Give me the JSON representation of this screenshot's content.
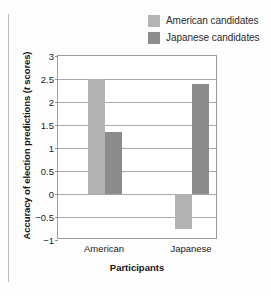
{
  "chart_data": {
    "type": "bar",
    "title": "",
    "xlabel": "Participants",
    "ylabel_prefix": "Accuracy of election predictions (",
    "ylabel_italic": "t",
    "ylabel_suffix": " scores)",
    "ylabel_full": "Accuracy of election predictions (t scores)",
    "categories": [
      "American",
      "Japanese"
    ],
    "series": [
      {
        "name": "American candidates",
        "color": "#b3b3b3",
        "values": [
          2.5,
          -0.75
        ]
      },
      {
        "name": "Japanese candidates",
        "color": "#8c8c8c",
        "values": [
          1.35,
          2.4
        ]
      }
    ],
    "ylim": [
      -1,
      3
    ],
    "yticks": [
      "3",
      "2.5",
      "2",
      "1.5",
      "1",
      "0.5",
      "0",
      "−0.5",
      "−1"
    ],
    "ytick_values": [
      3,
      2.5,
      2,
      1.5,
      1,
      0.5,
      0,
      -0.5,
      -1
    ],
    "grid": true,
    "legend_position": "top-right"
  },
  "legend": {
    "entries": [
      {
        "label": "American candidates",
        "swatch": "light"
      },
      {
        "label": "Japanese candidates",
        "swatch": "dark"
      }
    ]
  }
}
